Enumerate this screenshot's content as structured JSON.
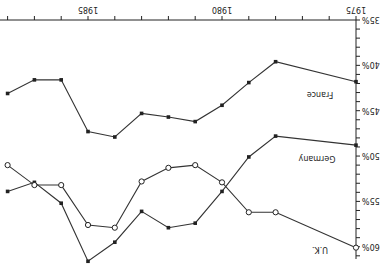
{
  "chart_data": {
    "type": "line",
    "title": "",
    "xlabel": "",
    "ylabel": "",
    "x": [
      1975,
      1978,
      1979,
      1980,
      1981,
      1982,
      1983,
      1984,
      1985,
      1986,
      1987,
      1988
    ],
    "x_ticks": [
      1975,
      1980,
      1985
    ],
    "y_ticks": [
      "35%",
      "40%",
      "45%",
      "50%",
      "55%",
      "60%"
    ],
    "ylim": [
      35,
      61
    ],
    "grid": false,
    "orientation": "rotated 180 degrees",
    "series": [
      {
        "name": "France",
        "marker": "filled-square",
        "values": [
          41.8,
          39.6,
          41.9,
          44.4,
          46.2,
          45.7,
          45.3,
          47.9,
          47.3,
          41.6,
          41.6,
          43.1
        ]
      },
      {
        "name": "Germany",
        "marker": "filled-square",
        "values": [
          48.8,
          47.8,
          50.1,
          53.9,
          57.4,
          57.9,
          56.1,
          59.5,
          61.6,
          55.2,
          52.9,
          53.9
        ]
      },
      {
        "name": "U.K.",
        "marker": "open-circle",
        "values": [
          60.1,
          56.2,
          56.2,
          52.9,
          51.0,
          51.3,
          52.8,
          57.9,
          57.6,
          53.2,
          53.2,
          51.0
        ]
      }
    ]
  }
}
